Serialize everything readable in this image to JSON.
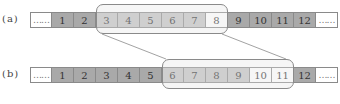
{
  "colors": {
    "dark": "#a9a9a9",
    "medium": "#c4c4c4",
    "light": "#ffffff",
    "line": "#8a8a8a"
  },
  "rows": [
    {
      "label": "(a)",
      "cells": [
        {
          "text": "……",
          "shade": "light",
          "dots": true
        },
        {
          "text": "1",
          "shade": "dark"
        },
        {
          "text": "2",
          "shade": "dark"
        },
        {
          "text": "3",
          "shade": "medium"
        },
        {
          "text": "4",
          "shade": "medium"
        },
        {
          "text": "5",
          "shade": "medium"
        },
        {
          "text": "6",
          "shade": "medium"
        },
        {
          "text": "7",
          "shade": "medium"
        },
        {
          "text": "8",
          "shade": "light"
        },
        {
          "text": "9",
          "shade": "dark"
        },
        {
          "text": "10",
          "shade": "dark"
        },
        {
          "text": "11",
          "shade": "dark"
        },
        {
          "text": "12",
          "shade": "dark"
        },
        {
          "text": "……",
          "shade": "light",
          "dots": true
        }
      ],
      "window": {
        "from": "3",
        "to": "8"
      }
    },
    {
      "label": "(b)",
      "cells": [
        {
          "text": "……",
          "shade": "light",
          "dots": true
        },
        {
          "text": "1",
          "shade": "dark"
        },
        {
          "text": "2",
          "shade": "dark"
        },
        {
          "text": "3",
          "shade": "dark"
        },
        {
          "text": "4",
          "shade": "dark"
        },
        {
          "text": "5",
          "shade": "dark"
        },
        {
          "text": "6",
          "shade": "medium"
        },
        {
          "text": "7",
          "shade": "medium"
        },
        {
          "text": "8",
          "shade": "medium"
        },
        {
          "text": "9",
          "shade": "medium"
        },
        {
          "text": "10",
          "shade": "light"
        },
        {
          "text": "11",
          "shade": "light"
        },
        {
          "text": "12",
          "shade": "dark"
        },
        {
          "text": "……",
          "shade": "light",
          "dots": true
        }
      ],
      "window": {
        "from": "6",
        "to": "11"
      }
    }
  ]
}
